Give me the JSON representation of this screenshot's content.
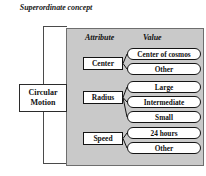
{
  "diagram": {
    "superordinate_label": "Superordinate concept",
    "root_concept": "Circular Motion",
    "headers": {
      "attribute": "Attribute",
      "value": "Value"
    },
    "attributes": [
      {
        "name": "Center",
        "values": [
          "Center of cosmos",
          "Other"
        ]
      },
      {
        "name": "Radius",
        "values": [
          "Large",
          "Intermediate",
          "Small"
        ]
      },
      {
        "name": "Speed",
        "values": [
          "24 hours",
          "Other"
        ]
      }
    ],
    "flat_values": [
      "Center of cosmos",
      "Other",
      "Large",
      "Intermediate",
      "Small",
      "24 hours",
      "Other"
    ],
    "colors": {
      "panel_background": "#c9c9c9",
      "panel_border": "#6e6e6e",
      "page_background": "#ffffff",
      "line": "#141414",
      "bracket_line": "#4a4a4a",
      "text": "#111111"
    }
  }
}
